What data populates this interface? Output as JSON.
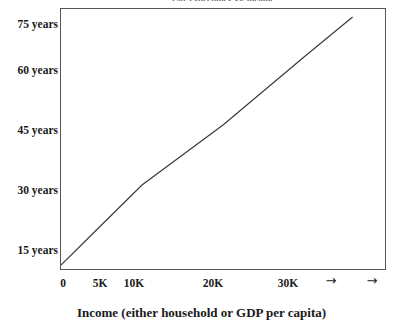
{
  "chart_data": {
    "type": "line",
    "title": "Life expectancy vs. income",
    "xlabel": "Income (either household or GDP per capita)",
    "ylabel": "",
    "grid": false,
    "legend": "none",
    "xlim": [
      0,
      40000
    ],
    "ylim": [
      12,
      77
    ],
    "x_tick_labels": [
      "0",
      "5K",
      "10K",
      "20K",
      "30K"
    ],
    "x_tick_values": [
      0,
      5000,
      10000,
      20000,
      30000
    ],
    "x_tick_positions_px": [
      63,
      100,
      133,
      213,
      287
    ],
    "x_extra_marks": [
      "→",
      "→"
    ],
    "x_extra_positions_px": [
      331,
      372
    ],
    "y_tick_labels": [
      "75 years",
      "60 years",
      "45 years",
      "30 years",
      "15 years"
    ],
    "y_tick_values": [
      75,
      60,
      45,
      30,
      15
    ],
    "y_tick_positions_px": [
      24,
      70,
      130,
      190,
      250
    ],
    "series": [
      {
        "name": "Life expectancy",
        "x": [
          0,
          5000,
          10000,
          20000,
          30000,
          36000
        ],
        "values": [
          13,
          23,
          33,
          48,
          65,
          75
        ],
        "color": "#3b3b3b"
      }
    ]
  },
  "axes": {
    "y_ticks": [
      {
        "label": "75 years",
        "value": 75
      },
      {
        "label": "60 years",
        "value": 60
      },
      {
        "label": "45 years",
        "value": 45
      },
      {
        "label": "30 years",
        "value": 30
      },
      {
        "label": "15 years",
        "value": 15
      }
    ],
    "x_ticks": [
      {
        "label": "0",
        "value": 0
      },
      {
        "label": "5K",
        "value": 5000
      },
      {
        "label": "10K",
        "value": 10000
      },
      {
        "label": "20K",
        "value": 20000
      },
      {
        "label": "30K",
        "value": 30000
      }
    ],
    "x_arrows": [
      {
        "label": "→"
      },
      {
        "label": "→"
      }
    ],
    "x_title": "Income (either household or GDP per capita)"
  },
  "colors": {
    "line": "#3b3b3b",
    "frame": "#555555",
    "text": "#1a1a1a",
    "background": "#ffffff"
  },
  "title_strip": "Life expectancy vs. income"
}
